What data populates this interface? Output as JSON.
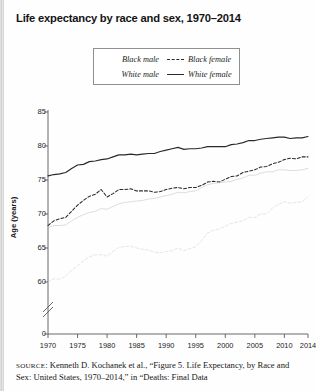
{
  "title": "Life expectancy by race and sex, 1970–2014",
  "legend": {
    "position": "top-center-inside",
    "entries": [
      {
        "label": "Black male",
        "style": "none",
        "column": 1,
        "row": 1
      },
      {
        "label": "Black female",
        "style": "dashed",
        "column": 2,
        "row": 1
      },
      {
        "label": "White male",
        "style": "none",
        "column": 1,
        "row": 2
      },
      {
        "label": "White female",
        "style": "solid",
        "column": 2,
        "row": 2
      }
    ]
  },
  "axes": {
    "ylabel": "Age (years)",
    "y_ticks": [
      "85",
      "80",
      "75",
      "70",
      "65",
      "60",
      "0"
    ],
    "y_axis_break": true,
    "x_ticks": [
      "1970",
      "1975",
      "1980",
      "1985",
      "1990",
      "1995",
      "2000",
      "2005",
      "2010",
      "2014"
    ]
  },
  "source": {
    "prefix": "SOURCE",
    "line1": ": Kenneth D. Kochanek et al., “Figure 5. Life Expectancy, by",
    "line2": "Race and Sex: United States, 1970–2014,” in “Deaths: Final Data"
  },
  "chart_data": {
    "type": "line",
    "title": "Life expectancy by race and sex, 1970–2014",
    "xlabel": "",
    "ylabel": "Age (years)",
    "xlim": [
      1970,
      2014
    ],
    "ylim": [
      58,
      85
    ],
    "y_axis_break_below": 60,
    "grid": false,
    "legend_position": "top-center-inside",
    "x": [
      1970,
      1971,
      1972,
      1973,
      1974,
      1975,
      1976,
      1977,
      1978,
      1979,
      1980,
      1981,
      1982,
      1983,
      1984,
      1985,
      1986,
      1987,
      1988,
      1989,
      1990,
      1991,
      1992,
      1993,
      1994,
      1995,
      1996,
      1997,
      1998,
      1999,
      2000,
      2001,
      2002,
      2003,
      2004,
      2005,
      2006,
      2007,
      2008,
      2009,
      2010,
      2011,
      2012,
      2013,
      2014
    ],
    "series": [
      {
        "name": "White female",
        "style": "solid",
        "color": "#2a2a2a",
        "values": [
          75.6,
          75.8,
          75.9,
          76.1,
          76.7,
          77.2,
          77.3,
          77.7,
          77.8,
          78.0,
          78.1,
          78.4,
          78.7,
          78.7,
          78.8,
          78.7,
          78.8,
          78.9,
          78.9,
          79.2,
          79.4,
          79.6,
          79.8,
          79.5,
          79.6,
          79.6,
          79.7,
          79.9,
          79.9,
          79.9,
          79.9,
          80.2,
          80.3,
          80.5,
          80.8,
          80.8,
          81.0,
          81.1,
          81.2,
          81.3,
          81.3,
          81.1,
          81.2,
          81.2,
          81.4
        ]
      },
      {
        "name": "Black female",
        "style": "dashed",
        "color": "#2a2a2a",
        "values": [
          68.3,
          69.0,
          69.3,
          69.5,
          70.4,
          71.3,
          72.0,
          72.6,
          72.9,
          73.6,
          72.5,
          73.0,
          73.6,
          73.6,
          73.7,
          73.4,
          73.4,
          73.4,
          73.2,
          73.3,
          73.6,
          73.8,
          73.9,
          73.7,
          73.9,
          73.9,
          74.2,
          74.7,
          74.8,
          74.7,
          75.1,
          75.5,
          75.6,
          76.1,
          76.3,
          76.5,
          76.9,
          77.0,
          77.4,
          77.6,
          78.0,
          78.2,
          78.1,
          78.4,
          78.4
        ]
      },
      {
        "name": "White male",
        "style": "solid-faint",
        "color": "#b8b8b8",
        "values": [
          68.0,
          68.3,
          68.3,
          68.4,
          69.0,
          69.5,
          69.9,
          70.2,
          70.4,
          70.8,
          70.7,
          71.1,
          71.5,
          71.7,
          71.8,
          71.9,
          72.0,
          72.2,
          72.3,
          72.5,
          72.7,
          72.9,
          73.2,
          73.1,
          73.3,
          73.4,
          73.9,
          74.3,
          74.5,
          74.6,
          74.7,
          74.8,
          75.1,
          75.3,
          75.7,
          75.7,
          76.0,
          76.2,
          76.2,
          76.5,
          76.5,
          76.4,
          76.4,
          76.5,
          76.7
        ]
      },
      {
        "name": "Black male",
        "style": "dashed-faint",
        "color": "#c4c4c4",
        "values": [
          60.0,
          60.5,
          60.4,
          60.9,
          61.7,
          62.4,
          63.1,
          63.7,
          64.0,
          64.0,
          63.8,
          64.5,
          65.1,
          65.2,
          65.3,
          65.0,
          64.8,
          64.7,
          64.4,
          64.3,
          64.5,
          64.6,
          65.0,
          64.6,
          64.9,
          65.2,
          66.1,
          67.2,
          67.6,
          67.8,
          68.2,
          68.6,
          68.8,
          69.0,
          69.5,
          69.5,
          70.0,
          70.0,
          70.9,
          71.4,
          71.8,
          71.6,
          71.7,
          71.8,
          72.5
        ]
      }
    ]
  }
}
